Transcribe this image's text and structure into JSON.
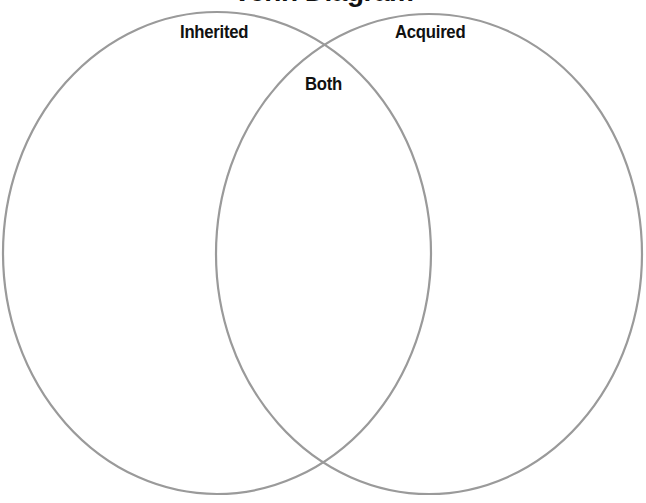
{
  "diagram": {
    "title": "Venn Diagram",
    "type": "venn",
    "stroke_color": "#9a9a9a",
    "sets": [
      {
        "id": "left",
        "label": "Inherited",
        "cx": 217,
        "cy": 253,
        "rx": 214,
        "ry": 241
      },
      {
        "id": "right",
        "label": "Acquired",
        "cx": 429,
        "cy": 254,
        "rx": 213,
        "ry": 240
      }
    ],
    "intersection": {
      "label": "Both"
    }
  }
}
